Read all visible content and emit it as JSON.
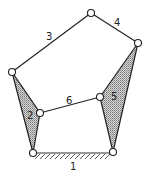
{
  "diagram": {
    "type": "six-bar linkage",
    "links": {
      "ground": "1",
      "left_ternary": "2",
      "top_left": "3",
      "top_right": "4",
      "right_ternary": "5",
      "coupler": "6"
    },
    "colors": {
      "line": "#222222",
      "hatch": "#888888",
      "joint_fill": "#ffffff"
    }
  }
}
